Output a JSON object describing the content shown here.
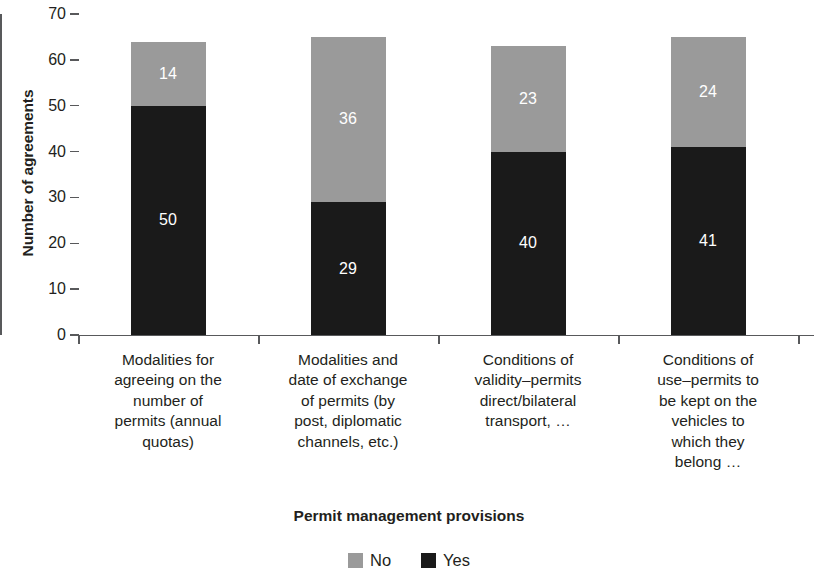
{
  "chart_data": {
    "type": "bar",
    "subtype": "stacked-bar",
    "title": "",
    "xlabel": "Permit management provisions",
    "ylabel": "Number of agreements",
    "ylim": [
      0,
      70
    ],
    "yticks": [
      0,
      10,
      20,
      30,
      40,
      50,
      60,
      70
    ],
    "ytick_labels": [
      "0",
      "10",
      "20",
      "30",
      "40",
      "50",
      "60",
      "70"
    ],
    "grid": false,
    "legend_position": "bottom-center",
    "categories": [
      "Modalities for agreeing on the number of permits (annual quotas)",
      "Modalities and date of exchange of permits (by post, diplomatic channels, etc.)",
      "Conditions of validity–permits direct/bilateral transport, …",
      "Conditions of use–permits to be kept on the vehicles to which they belong …"
    ],
    "category_lines": [
      [
        "Modalities for",
        "agreeing on the",
        "number of",
        "permits (annual",
        "quotas)"
      ],
      [
        "Modalities and",
        "date of exchange",
        "of permits (by",
        "post, diplomatic",
        "channels, etc.)"
      ],
      [
        "Conditions of",
        "validity–permits",
        "direct/bilateral",
        "transport, …"
      ],
      [
        "Conditions of",
        "use–permits to",
        "be kept on the",
        "vehicles to",
        "which they",
        "belong …"
      ]
    ],
    "series": [
      {
        "name": "Yes",
        "color": "#1a1a1a",
        "values": [
          50,
          29,
          40,
          41
        ]
      },
      {
        "name": "No",
        "color": "#9a9a9a",
        "values": [
          14,
          36,
          23,
          24
        ]
      }
    ],
    "stack_order_bottom_to_top": [
      "Yes",
      "No"
    ],
    "totals": [
      64,
      65,
      63,
      65
    ],
    "data_labels": {
      "yes": [
        "50",
        "29",
        "40",
        "41"
      ],
      "no": [
        "14",
        "36",
        "23",
        "24"
      ]
    }
  },
  "legend": {
    "items": [
      {
        "label": "No",
        "color": "#9a9a9a"
      },
      {
        "label": "Yes",
        "color": "#1a1a1a"
      }
    ]
  },
  "axes": {
    "y_title": "Number of agreements",
    "x_title": "Permit management provisions",
    "y_tick_labels": [
      "70",
      "60",
      "50",
      "40",
      "30",
      "20",
      "10",
      "0"
    ]
  },
  "colors": {
    "axis": "#58595b",
    "text": "#231f20",
    "series_no": "#9a9a9a",
    "series_yes": "#1a1a1a",
    "label_text": "#ffffff",
    "background": "#ffffff"
  }
}
